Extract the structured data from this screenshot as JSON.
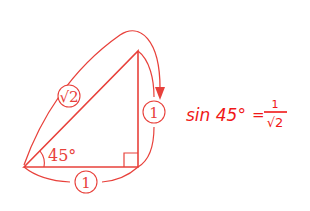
{
  "diagram": {
    "type": "right-triangle",
    "angle_label": "45°",
    "hypotenuse_label": "√2",
    "vertical_side_label": "1",
    "base_label": "1",
    "right_angle_marker": true,
    "color": "#e8413b"
  },
  "formula": {
    "lhs": "sin 45°",
    "equals": "=",
    "numerator": "1",
    "denominator": "√2",
    "text": "sin 45° = 1/√2",
    "color": "#f01818"
  }
}
